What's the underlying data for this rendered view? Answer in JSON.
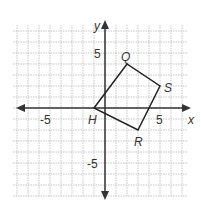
{
  "figure": {
    "type": "coordinate-plane",
    "axes": {
      "x_label": "x",
      "y_label": "y"
    },
    "tick_labels": {
      "x_neg": "-5",
      "x_pos": "5",
      "y_pos": "5",
      "y_neg": "-5"
    },
    "grid": {
      "x_min": -8,
      "x_max": 7,
      "y_min": -8,
      "y_max": 7,
      "step": 1
    },
    "polygon": {
      "name": "HQSR",
      "vertices": [
        {
          "label": "H",
          "x": -1,
          "y": 0
        },
        {
          "label": "Q",
          "x": 2,
          "y": 4
        },
        {
          "label": "S",
          "x": 5,
          "y": 2
        },
        {
          "label": "R",
          "x": 3,
          "y": -2
        }
      ]
    },
    "colors": {
      "grid": "#b8b8b8",
      "axis": "#333333",
      "shape": "#222222"
    }
  }
}
